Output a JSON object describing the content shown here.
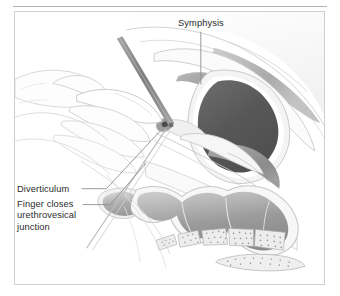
{
  "figure": {
    "type": "medical-illustration",
    "frame": {
      "border_color": "#cfcfcf",
      "background": "#ffffff"
    },
    "top_rule_color": "#b4b4b4"
  },
  "labels": {
    "symphysis": "Symphysis",
    "diverticulum": "Diverticulum",
    "finger_line1": "Finger closes",
    "finger_line2": "urethrovesical",
    "finger_line3": "junction",
    "text_color": "#2b2b2b"
  },
  "palette": {
    "outline": "#b9b9b9",
    "outline_soft": "#cdcdcd",
    "tissue_pale": "#f3f3f3",
    "tissue_light": "#e6e6e6",
    "bone_gray": "#9a9a9a",
    "bone_gray_light": "#b5b5b5",
    "bladder_dark": "#5a5a5a",
    "rectum_mid": "#8f8f8f",
    "rectum_light": "#c2c2c2",
    "instrument": "#8c8c8c",
    "leader_line": "#8f8f8f",
    "vertebra_fill": "#ededed",
    "vertebra_stipple": "#9d9d9d"
  },
  "anatomy": [
    {
      "name": "symphysis-pubis",
      "shade": "#9a9a9a"
    },
    {
      "name": "bladder-lumen",
      "shade": "#5a5a5a"
    },
    {
      "name": "bladder-wall",
      "shade": "#dcdcdc"
    },
    {
      "name": "uterus",
      "shade": "#9a9a9a"
    },
    {
      "name": "rectum",
      "shade": "#8f8f8f"
    },
    {
      "name": "sacrum-vertebrae",
      "shade": "#ededed"
    },
    {
      "name": "coccyx",
      "shade": "#ededed"
    },
    {
      "name": "examining-hand",
      "shade": "#fbfbfb"
    },
    {
      "name": "urethral-instrument",
      "shade": "#8c8c8c"
    },
    {
      "name": "urethral-diverticulum",
      "shade": "#9a9a9a"
    }
  ],
  "leaders": [
    {
      "name": "symphysis-leader",
      "from": "label-symphysis",
      "to": "symphysis-pubis"
    },
    {
      "name": "diverticulum-leader",
      "from": "label-diverticulum",
      "to": "urethral-diverticulum"
    },
    {
      "name": "finger-leader",
      "from": "label-finger",
      "to": "examining-hand"
    }
  ]
}
